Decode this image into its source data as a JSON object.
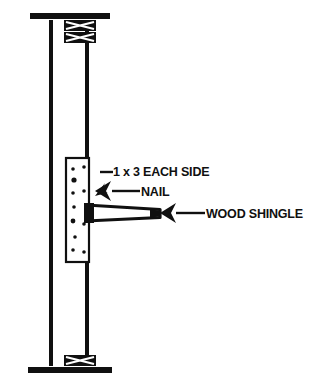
{
  "drawing": {
    "name": "wood-shingle-wall-stud-detail",
    "background_color": "#ffffff",
    "ink_color": "#101010",
    "width": 322,
    "height": 391
  },
  "callouts": [
    {
      "id": "furring-strip",
      "label": "1 x 3 EACH SIDE",
      "text_x": 113,
      "text_y": 176,
      "leader": "M100,172 L112,172",
      "arrow": "M95,195 L104,184 L100,192 L107,192 Z"
    },
    {
      "id": "nail",
      "label": "NAIL",
      "text_x": 140,
      "text_y": 196,
      "leader": "M111,191 L139,191",
      "arrow": "M96,191 L110,182 L105,191 L110,200 Z"
    },
    {
      "id": "wood-shingle",
      "label": "WOOD SHINGLE",
      "text_x": 205,
      "text_y": 218,
      "leader": "M172,213 L204,213",
      "arrow": "M158,213 L173,204 L168,213 L173,222 Z"
    }
  ],
  "components": {
    "stud": {
      "name": "wall-stud",
      "left_edge_x": 49,
      "right_edge_x": 89,
      "top_y": 22,
      "bottom_y": 362,
      "line_width": 4
    },
    "top_plate": {
      "name": "double-top-plate",
      "x": 30,
      "y": 13,
      "width": 80,
      "height": 7,
      "hatch_bands": 2
    },
    "bottom_plate": {
      "name": "bottom-sole-plate",
      "x": 28,
      "y": 368,
      "width": 84,
      "height": 7,
      "hatch_bands": 1
    },
    "furring_strip": {
      "name": "furring-strip-1x3",
      "x": 66,
      "y": 158,
      "width": 24,
      "height": 104,
      "nail_dots": [
        [
          73,
          170
        ],
        [
          84,
          168
        ],
        [
          75,
          181
        ],
        [
          73,
          194
        ],
        [
          84,
          192
        ],
        [
          75,
          207
        ],
        [
          73,
          221
        ],
        [
          84,
          224
        ],
        [
          75,
          236
        ],
        [
          73,
          250
        ],
        [
          84,
          252
        ]
      ]
    },
    "shingle": {
      "name": "wood-shingle-wedge",
      "butt_x": 88,
      "tip_x": 160,
      "butt_top_y": 206,
      "butt_bottom_y": 220,
      "tip_top_y": 210,
      "tip_bottom_y": 217
    }
  }
}
